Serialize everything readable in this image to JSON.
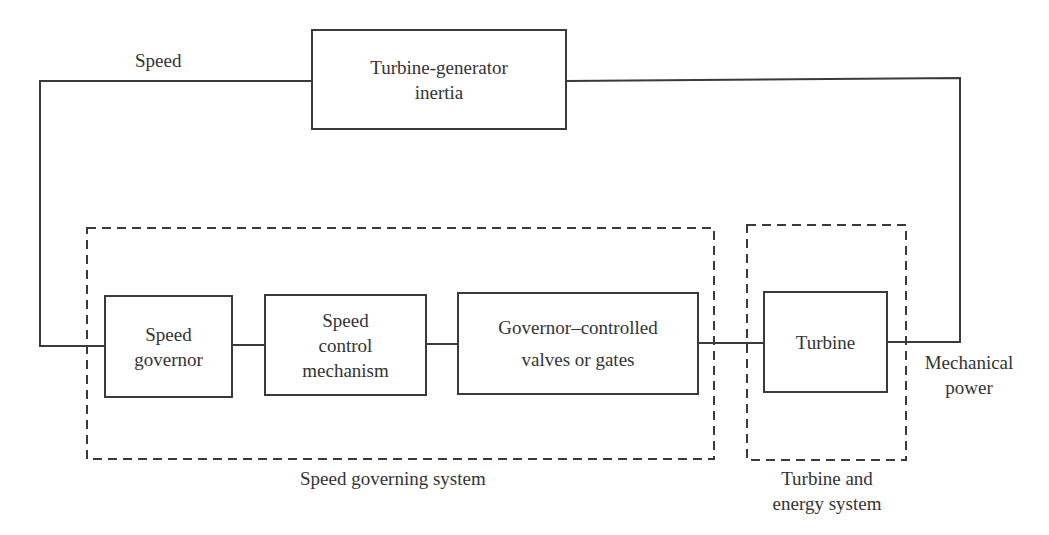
{
  "diagram": {
    "blocks": {
      "inertia": {
        "line1": "Turbine-generator",
        "line2": "inertia"
      },
      "speed_governor": {
        "line1": "Speed",
        "line2": "governor"
      },
      "speed_control": {
        "line1": "Speed",
        "line2": "control",
        "line3": "mechanism"
      },
      "valves": {
        "line1": "Governor–controlled",
        "line2": "valves or gates"
      },
      "turbine": {
        "line1": "Turbine"
      }
    },
    "groups": {
      "speed_governing_system": {
        "label": "Speed governing system"
      },
      "turbine_energy_system": {
        "line1": "Turbine and",
        "line2": "energy system"
      }
    },
    "signals": {
      "speed": "Speed",
      "mechanical_power": {
        "line1": "Mechanical",
        "line2": "power"
      }
    },
    "connections": [
      [
        "Turbine-generator inertia",
        "Speed governor",
        "Speed"
      ],
      [
        "Speed governor",
        "Speed control mechanism",
        ""
      ],
      [
        "Speed control mechanism",
        "Governor–controlled valves or gates",
        ""
      ],
      [
        "Governor–controlled valves or gates",
        "Turbine",
        ""
      ],
      [
        "Turbine",
        "Turbine-generator inertia",
        "Mechanical power"
      ]
    ],
    "colors": {
      "line": "#3a3a3a",
      "text": "#333333",
      "background": "#ffffff"
    }
  }
}
